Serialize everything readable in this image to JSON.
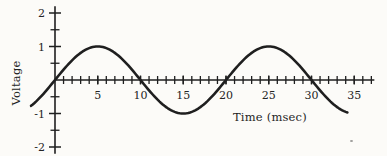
{
  "figure": {
    "background_color": "#fcfbf8",
    "ink_color": "#1f1f1f"
  },
  "chart_data": {
    "type": "line",
    "title": "",
    "xlabel": "Time (msec)",
    "ylabel": "Voltage",
    "x_range": [
      -3,
      37
    ],
    "y_range": [
      -2.2,
      2.2
    ],
    "x_tick_values": [
      5,
      10,
      15,
      20,
      25,
      30,
      35
    ],
    "x_tick_labels": [
      "5",
      "10",
      "15",
      "20",
      "25",
      "30",
      "35"
    ],
    "x_minor_tick_step": 1,
    "x_minor_tick_range": [
      1,
      37
    ],
    "y_tick_values": [
      2,
      1,
      -1,
      -2
    ],
    "y_tick_labels": [
      "2",
      "1",
      "-1",
      "-2"
    ],
    "y_minor_tick_step": 0.5,
    "grid": false,
    "legend": false,
    "series": [
      {
        "name": "voltage-waveform",
        "shape": "sine",
        "amplitude_V": 1,
        "period_msec": 20,
        "phase_deg": 0,
        "t_start_msec": -2.8,
        "t_end_msec": 34.2,
        "key_points": [
          [
            0,
            0
          ],
          [
            5,
            1
          ],
          [
            10,
            0
          ],
          [
            15,
            -1
          ],
          [
            20,
            0
          ],
          [
            25,
            1
          ],
          [
            30,
            0
          ],
          [
            35,
            -1
          ]
        ]
      }
    ]
  }
}
